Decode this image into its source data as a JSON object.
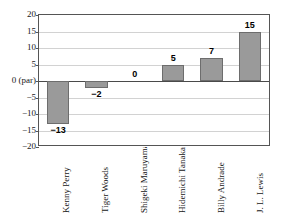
{
  "chart_data": {
    "type": "bar",
    "title": "",
    "subtitle": "",
    "xlabel": "",
    "ylabel": "",
    "categories": [
      "Kenny Perry",
      "Tiger Woods",
      "Shigeki Maruyama",
      "Hidemichi Tanaka",
      "Billy Andrade",
      "J. L. Lewis"
    ],
    "values": [
      -13,
      -2,
      0,
      5,
      7,
      15
    ],
    "data_labels": [
      "−13",
      "−2",
      "0",
      "5",
      "7",
      "15"
    ],
    "ylim": [
      -20,
      20
    ],
    "ytick_values": [
      20,
      15,
      10,
      5,
      0,
      -5,
      -10,
      -15,
      -20
    ],
    "ytick_labels": [
      "20",
      "15",
      "10",
      "5",
      "0 (par)",
      "−5",
      "−10",
      "−15",
      "−20"
    ],
    "grid": true,
    "grid_axis": "y",
    "legend": false,
    "legend_position": "none",
    "zero_reference_label": "0 (par)",
    "colors": {
      "bar_fill": "#9a9a9a",
      "bar_stroke": "#6d6d6d",
      "gridline": "#d2d2d2",
      "axis": "#555555",
      "zero_line": "#4a4a4a",
      "text": "#151515",
      "background": "#ffffff"
    }
  }
}
